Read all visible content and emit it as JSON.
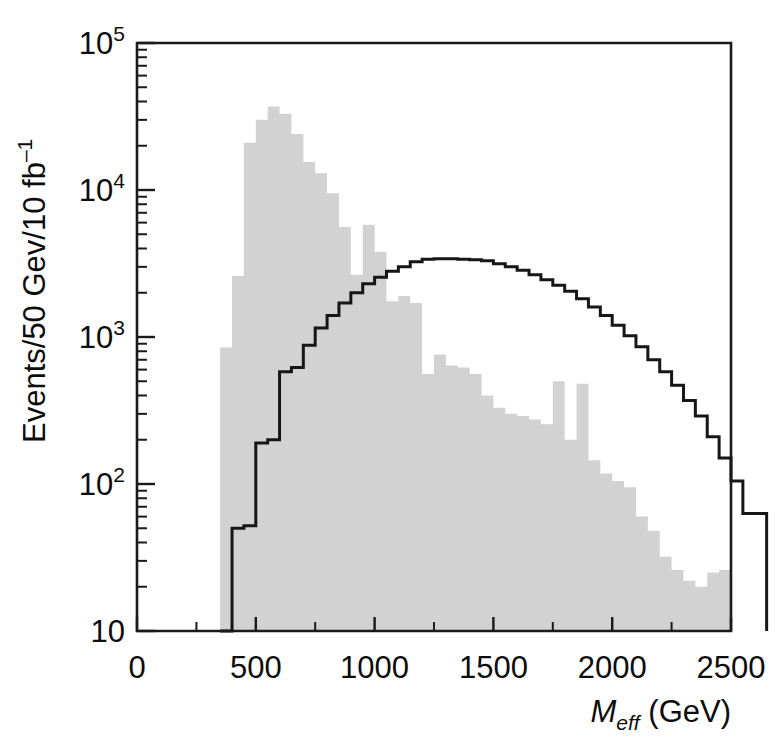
{
  "figure": {
    "name": "m-eff-distribution",
    "background": "#ffffff"
  },
  "chart_data": {
    "type": "area",
    "title": "",
    "subtitle": "",
    "xlabel": "M_eff (GeV)",
    "xlabel_parts": {
      "italic": "M",
      "subscript": "eff",
      "rest": " (GeV)"
    },
    "ylabel": "Events/50 Gev/10 fb⁻¹",
    "ylabel_parts": {
      "main": "Events/50 Gev/10 fb",
      "exponent": "–1"
    },
    "xlim": [
      0,
      2500
    ],
    "ylim": [
      10,
      100000
    ],
    "yscale": "log",
    "xscale": "linear",
    "grid": false,
    "legend": null,
    "bin_width": 50,
    "x_major_ticks": [
      0,
      500,
      1000,
      1500,
      2000,
      2500
    ],
    "x_major_tick_labels": [
      "0",
      "500",
      "1000",
      "1500",
      "2000",
      "2500"
    ],
    "x_minor_tick_step": 250,
    "y_major_ticks": [
      10,
      100,
      1000,
      10000,
      100000
    ],
    "y_major_tick_labels": [
      "10",
      "10²",
      "10³",
      "10⁴",
      "10⁵"
    ],
    "y_major_tick_label_parts": [
      {
        "base": "10",
        "exp": ""
      },
      {
        "base": "10",
        "exp": "2"
      },
      {
        "base": "10",
        "exp": "3"
      },
      {
        "base": "10",
        "exp": "4"
      },
      {
        "base": "10",
        "exp": "5"
      }
    ],
    "colors": {
      "fill_gray": "#d2d2d2",
      "line_black": "#161616",
      "axis": "#1a1a1a"
    },
    "series": [
      {
        "name": "signal-filled-histogram",
        "style": "filled-gray",
        "fill": "#d2d2d2",
        "bin_start": 350,
        "bin_width": 50,
        "values": [
          850,
          2600,
          21000,
          30000,
          37000,
          33000,
          24000,
          15500,
          13000,
          9500,
          5600,
          2650,
          5800,
          3800,
          1750,
          1900,
          1700,
          560,
          760,
          640,
          620,
          560,
          400,
          330,
          300,
          290,
          275,
          255,
          500,
          200,
          480,
          145,
          118,
          105,
          95,
          60,
          48,
          32,
          26,
          22,
          20,
          25,
          26
        ]
      },
      {
        "name": "background-outline-histogram",
        "style": "black-step-line",
        "stroke": "#161616",
        "bin_start": 350,
        "bin_width": 50,
        "values": [
          10,
          50,
          52,
          190,
          200,
          580,
          620,
          880,
          1150,
          1400,
          1700,
          2000,
          2300,
          2550,
          2800,
          3000,
          3250,
          3380,
          3400,
          3400,
          3380,
          3350,
          3300,
          3150,
          3000,
          2850,
          2650,
          2450,
          2250,
          2050,
          1820,
          1600,
          1400,
          1200,
          1020,
          860,
          700,
          580,
          470,
          370,
          290,
          210,
          150,
          105,
          63,
          63
        ]
      }
    ]
  }
}
